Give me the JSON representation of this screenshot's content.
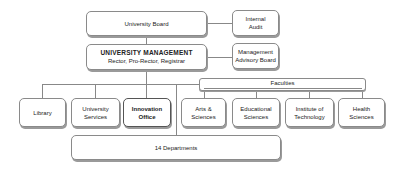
{
  "diagram": {
    "top": {
      "board": "University Board",
      "internal_audit": [
        "Internal",
        "Audit"
      ],
      "management_title": "UNIVERSITY MANAGEMENT",
      "management_sub": "Rector, Pro-Rector, Registrar",
      "advisory_board": [
        "Management",
        "Advisory Board"
      ]
    },
    "units": [
      {
        "lines": [
          "Library"
        ]
      },
      {
        "lines": [
          "University",
          "Services"
        ]
      },
      {
        "lines": [
          "Innovation",
          "Office"
        ]
      }
    ],
    "faculties_label": "Faculties",
    "faculties": [
      {
        "lines": [
          "Arts &",
          "Sciences"
        ]
      },
      {
        "lines": [
          "Educational",
          "Sciences"
        ]
      },
      {
        "lines": [
          "Institute of",
          "Technology"
        ]
      },
      {
        "lines": [
          "Health",
          "Sciences"
        ]
      }
    ],
    "departments": "14 Departments"
  }
}
